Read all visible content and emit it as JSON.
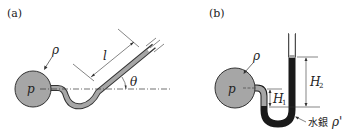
{
  "figure": {
    "panel_a": {
      "label": "(a)",
      "density_label": "ρ",
      "pressure_label": "p",
      "length_label": "l",
      "angle_label": "θ",
      "description": "inclined-tube manometer"
    },
    "panel_b": {
      "label": "(b)",
      "density_label": "ρ",
      "pressure_label": "p",
      "h1_label": "H",
      "h1_sub": "1",
      "h2_label": "H",
      "h2_sub": "2",
      "mercury_label": "水銀",
      "mercury_density_label": "ρ'",
      "description": "U-tube mercury manometer"
    },
    "colors": {
      "fluid": "#a6a6a6",
      "mercury": "#1a1a1a",
      "line": "#222222",
      "background": "#ffffff"
    }
  }
}
